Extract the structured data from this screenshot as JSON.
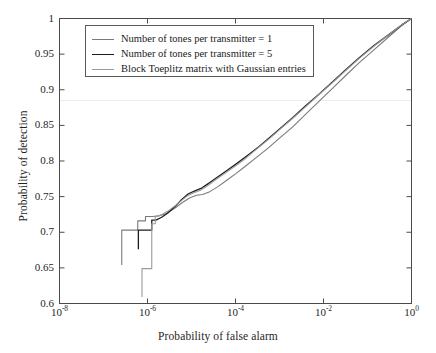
{
  "chart_data": {
    "type": "line",
    "title": "",
    "xlabel": "Probability of false alarm",
    "ylabel": "Probability of detection",
    "xscale": "log",
    "yscale": "linear",
    "xlim": [
      1e-08,
      1
    ],
    "ylim": [
      0.6,
      1.0
    ],
    "xticks": [
      1e-08,
      1e-06,
      0.0001,
      0.01,
      1
    ],
    "xtick_labels": [
      "10-8",
      "10-6",
      "10-4",
      "10-2",
      "100"
    ],
    "xtick_mantissa": "10",
    "xtick_exponents": [
      "-8",
      "-6",
      "-4",
      "-2",
      "0"
    ],
    "yticks": [
      0.6,
      0.65,
      0.7,
      0.75,
      0.8,
      0.85,
      0.9,
      0.95,
      1
    ],
    "ytick_labels": [
      "0.6",
      "0.65",
      "0.7",
      "0.75",
      "0.8",
      "0.85",
      "0.9",
      "0.95",
      "1"
    ],
    "grid": false,
    "legend_position": "upper left",
    "series": [
      {
        "name": "Number of tones per transmitter = 1",
        "color": "#7a7a7a",
        "width": 1.1,
        "points": [
          [
            2.6e-07,
            0.654
          ],
          [
            2.6e-07,
            0.703
          ],
          [
            6e-07,
            0.703
          ],
          [
            6e-07,
            0.716
          ],
          [
            9e-07,
            0.716
          ],
          [
            9e-07,
            0.722
          ],
          [
            1.3e-06,
            0.722
          ],
          [
            1.8e-06,
            0.723
          ],
          [
            2.6e-06,
            0.726
          ],
          [
            4e-06,
            0.733
          ],
          [
            6e-06,
            0.741
          ],
          [
            9e-06,
            0.748
          ],
          [
            1.3e-05,
            0.752
          ],
          [
            1.8e-05,
            0.753
          ],
          [
            2.6e-05,
            0.757
          ],
          [
            4e-05,
            0.764
          ],
          [
            6e-05,
            0.772
          ],
          [
            0.0001,
            0.782
          ],
          [
            0.00017,
            0.793
          ],
          [
            0.0003,
            0.805
          ],
          [
            0.00055,
            0.818
          ],
          [
            0.001,
            0.832
          ],
          [
            0.002,
            0.848
          ],
          [
            0.004,
            0.866
          ],
          [
            0.008,
            0.884
          ],
          [
            0.016,
            0.902
          ],
          [
            0.032,
            0.92
          ],
          [
            0.065,
            0.938
          ],
          [
            0.14,
            0.956
          ],
          [
            0.3,
            0.974
          ],
          [
            0.6,
            0.99
          ],
          [
            1.0,
            1.0
          ]
        ]
      },
      {
        "name": "Number of tones per transmitter = 5",
        "color": "#1c1c1c",
        "width": 1.3,
        "points": [
          [
            6.2e-07,
            0.676
          ],
          [
            6.2e-07,
            0.703
          ],
          [
            1.25e-06,
            0.703
          ],
          [
            1.25e-06,
            0.717
          ],
          [
            1.55e-06,
            0.717
          ],
          [
            2.1e-06,
            0.721
          ],
          [
            2.9e-06,
            0.727
          ],
          [
            4.2e-06,
            0.736
          ],
          [
            6e-06,
            0.746
          ],
          [
            8.5e-06,
            0.754
          ],
          [
            1.2e-05,
            0.758
          ],
          [
            1.7e-05,
            0.762
          ],
          [
            2.5e-05,
            0.769
          ],
          [
            4e-05,
            0.778
          ],
          [
            6.5e-05,
            0.787
          ],
          [
            0.00011,
            0.797
          ],
          [
            0.00019,
            0.808
          ],
          [
            0.00034,
            0.82
          ],
          [
            0.0006,
            0.833
          ],
          [
            0.0011,
            0.847
          ],
          [
            0.0021,
            0.862
          ],
          [
            0.004,
            0.878
          ],
          [
            0.008,
            0.894
          ],
          [
            0.016,
            0.911
          ],
          [
            0.032,
            0.928
          ],
          [
            0.065,
            0.945
          ],
          [
            0.14,
            0.962
          ],
          [
            0.3,
            0.977
          ],
          [
            0.6,
            0.991
          ],
          [
            1.0,
            1.0
          ]
        ]
      },
      {
        "name": "Block Toeplitz matrix with Gaussian entries",
        "color": "#9a9a9a",
        "width": 1.1,
        "points": [
          [
            7.5e-07,
            0.609
          ],
          [
            7.5e-07,
            0.649
          ],
          [
            1.25e-06,
            0.649
          ],
          [
            1.25e-06,
            0.712
          ],
          [
            1.5e-06,
            0.712
          ],
          [
            1.5e-06,
            0.722
          ],
          [
            2e-06,
            0.724
          ],
          [
            2.8e-06,
            0.729
          ],
          [
            4e-06,
            0.736
          ],
          [
            5.8e-06,
            0.744
          ],
          [
            8e-06,
            0.751
          ],
          [
            1.1e-05,
            0.755
          ],
          [
            1.6e-05,
            0.759
          ],
          [
            2.4e-05,
            0.766
          ],
          [
            3.8e-05,
            0.775
          ],
          [
            6.2e-05,
            0.784
          ],
          [
            0.000105,
            0.794
          ],
          [
            0.00018,
            0.805
          ],
          [
            0.00032,
            0.818
          ],
          [
            0.00058,
            0.831
          ],
          [
            0.00105,
            0.845
          ],
          [
            0.002,
            0.86
          ],
          [
            0.0039,
            0.876
          ],
          [
            0.0078,
            0.893
          ],
          [
            0.016,
            0.91
          ],
          [
            0.032,
            0.927
          ],
          [
            0.065,
            0.944
          ],
          [
            0.14,
            0.961
          ],
          [
            0.3,
            0.977
          ],
          [
            0.6,
            0.991
          ],
          [
            1.0,
            1.0
          ]
        ]
      }
    ]
  },
  "axes": {
    "xlabel": "Probability of false alarm",
    "ylabel": "Probability of detection"
  },
  "ytick_labels": [
    "1",
    "0.95",
    "0.9",
    "0.85",
    "0.8",
    "0.75",
    "0.7",
    "0.65",
    "0.6"
  ],
  "legend": {
    "items": [
      {
        "label": "Number of tones per transmitter = 1",
        "color": "#7a7a7a"
      },
      {
        "label": "Number of tones per transmitter = 5",
        "color": "#1c1c1c"
      },
      {
        "label": "Block Toeplitz matrix with Gaussian entries",
        "color": "#9a9a9a"
      }
    ]
  },
  "xtick_mantissa": "10",
  "xtick_exponents": [
    "-8",
    "-6",
    "-4",
    "-2",
    "0"
  ],
  "colors": {
    "frame": "#4a4a4a",
    "background": "#ffffff",
    "text": "#1a1a1a"
  }
}
